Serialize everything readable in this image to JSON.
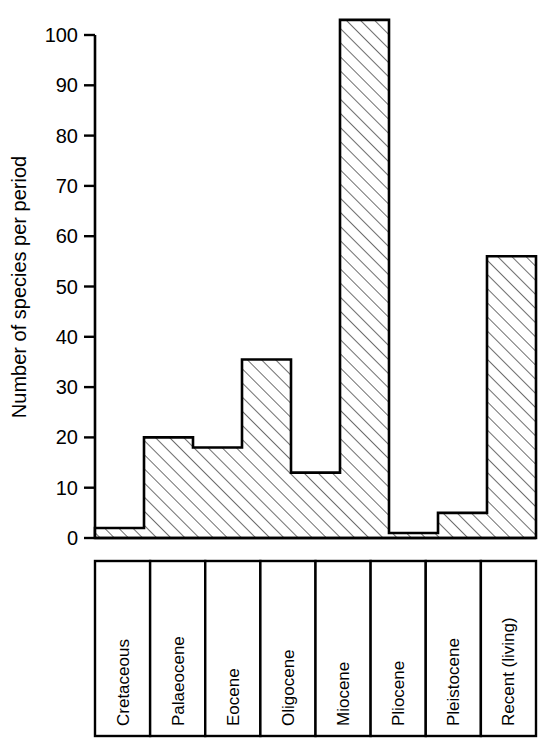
{
  "chart_data": {
    "type": "bar",
    "title": "",
    "subtitle": "",
    "xlabel": "",
    "ylabel": "Number of species per period",
    "categories": [
      "Cretaceous",
      "Palaeocene",
      "Eocene",
      "Oligocene",
      "Miocene",
      "Pliocene",
      "Pleistocene",
      "Recent (living)"
    ],
    "values": [
      2,
      20,
      18,
      35.5,
      13,
      103,
      1,
      5
    ],
    "series": [
      {
        "name": "Number of species per period",
        "values": [
          2,
          20,
          18,
          35.5,
          13,
          103,
          1,
          5
        ]
      }
    ],
    "bars": [
      {
        "category": "Cretaceous",
        "value": 2
      },
      {
        "category": "Palaeocene",
        "value": 20
      },
      {
        "category": "Eocene",
        "value": 18
      },
      {
        "category": "Oligocene",
        "value": 35.5
      },
      {
        "category": "Miocene",
        "value": 13
      },
      {
        "category": "Pliocene",
        "value": 103
      },
      {
        "category": "Pleistocene",
        "value": 1
      },
      {
        "category": "Recent (living)",
        "value": 5
      }
    ],
    "display_bars": [
      {
        "label": "Cretaceous",
        "value": 2
      },
      {
        "label": "Palaeocene",
        "value": 20
      },
      {
        "label": "Eocene",
        "value": 18
      },
      {
        "label": "Oligocene",
        "value": 35.5
      },
      {
        "label": "Miocene",
        "value": 13
      },
      {
        "label": "Pliocene",
        "value": 103
      },
      {
        "label": "Pleistocene",
        "value": 1
      },
      {
        "label": "Recent (living)",
        "value": 5
      }
    ],
    "step_heights": [
      2,
      20,
      18,
      35.5,
      13,
      103,
      1,
      5,
      56
    ],
    "ylim": [
      0,
      105
    ],
    "ytick_values": [
      0,
      10,
      20,
      30,
      40,
      50,
      60,
      70,
      80,
      90,
      100
    ],
    "ytick_labels": [
      "0",
      "10",
      "20",
      "30",
      "40",
      "50",
      "60",
      "70",
      "80",
      "90",
      "100"
    ],
    "grid": false,
    "legend": false,
    "legend_position": "none",
    "bar_fill": "diagonal-hatch",
    "bar_edge_color": "#000000",
    "background_color": "#ffffff"
  },
  "axes": {
    "y_title": "Number of species per period",
    "tick_labels": [
      "100",
      "90",
      "80",
      "70",
      "60",
      "50",
      "40",
      "30",
      "20",
      "10",
      "0"
    ]
  },
  "category_boxes": [
    {
      "label": "Cretaceous"
    },
    {
      "label": "Palaeocene"
    },
    {
      "label": "Eocene"
    },
    {
      "label": "Oligocene"
    },
    {
      "label": "Miocene"
    },
    {
      "label": "Pliocene"
    },
    {
      "label": "Pleistocene"
    },
    {
      "label": "Recent (living)"
    }
  ]
}
